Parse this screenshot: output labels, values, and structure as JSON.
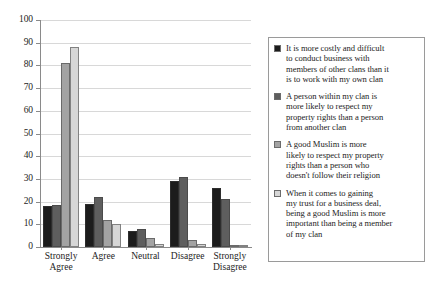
{
  "chart_data": {
    "type": "bar",
    "title": "",
    "subtitle": "",
    "xlabel": "",
    "ylabel": "",
    "ylim": [
      0,
      100
    ],
    "ytick_labels": [
      "100",
      "90",
      "80",
      "70",
      "60",
      "50",
      "40",
      "30",
      "20",
      "10",
      "0"
    ],
    "ytick_values": [
      100,
      90,
      80,
      70,
      60,
      50,
      40,
      30,
      20,
      10,
      0
    ],
    "grid": true,
    "legend_position": "right",
    "categories": [
      "Strongly Agree",
      "Agree",
      "Neutral",
      "Disagree",
      "Strongly Disagree"
    ],
    "category_lines": [
      [
        "Strongly",
        "Agree"
      ],
      [
        "Agree"
      ],
      [
        "Neutral"
      ],
      [
        "Disagree"
      ],
      [
        "Strongly",
        "Disagree"
      ]
    ],
    "series": [
      {
        "name": "It is more costly and difficult to conduct business with members of other clans than it is to work with my own clan",
        "color": "#1c1c1c",
        "values": [
          18,
          19,
          7,
          29,
          26
        ]
      },
      {
        "name": "A person within my clan is more likely to respect my property rights than a person from another clan",
        "color": "#5e5e5e",
        "values": [
          18.5,
          22,
          8,
          31,
          21
        ]
      },
      {
        "name": "A good Muslim is more likely to respect my property rights than a person who doesn't follow their religion",
        "color": "#a3a3a3",
        "values": [
          81,
          12,
          4,
          3,
          1
        ]
      },
      {
        "name": "When it comes to gaining my trust for a business deal, being a good Muslim is more important than being a member of my clan",
        "color": "#d6d6d6",
        "values": [
          88,
          10,
          1.5,
          1.5,
          0.5
        ]
      }
    ]
  },
  "legend": {
    "items": [
      {
        "swatch_color": "#1c1c1c",
        "lines": [
          "It is more costly and difficult",
          "to conduct business with",
          "members of other clans than it",
          "is to work with my own clan"
        ]
      },
      {
        "swatch_color": "#5e5e5e",
        "lines": [
          "A person within my clan is",
          "more likely to respect my",
          "property rights than a person",
          "from another clan"
        ]
      },
      {
        "swatch_color": "#a3a3a3",
        "lines": [
          "A good Muslim is more",
          "likely to respect my property",
          "rights than a person who",
          "doesn't follow their religion"
        ]
      },
      {
        "swatch_color": "#d6d6d6",
        "lines": [
          "When it comes to gaining",
          "my trust for a business deal,",
          "being a good Muslim is more",
          "important than being a member",
          "of my clan"
        ]
      }
    ]
  }
}
